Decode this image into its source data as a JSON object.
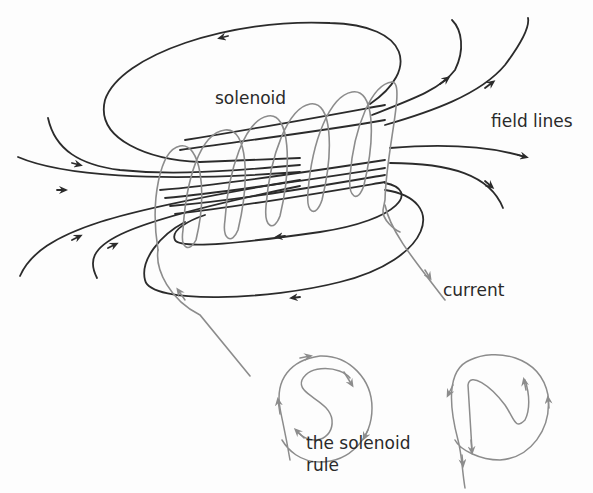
{
  "diagram": {
    "labels": {
      "solenoid": "solenoid",
      "field_lines": "field lines",
      "current": "current",
      "rule_line1": "the solenoid",
      "rule_line2": "rule"
    },
    "rule_symbols": [
      {
        "letter": "S",
        "direction": "clockwise"
      },
      {
        "letter": "N",
        "direction": "anticlockwise"
      }
    ],
    "coil_turns": 6,
    "colors": {
      "field_line": "#2b2b2b",
      "coil": "#8c8c8c",
      "text": "#2a2a2a",
      "background": "#fdfdfd"
    }
  }
}
